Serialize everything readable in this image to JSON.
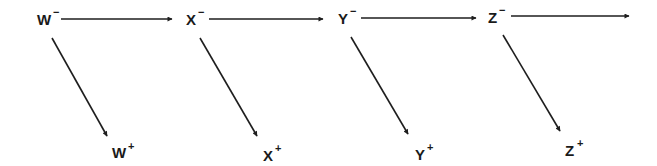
{
  "diagram": {
    "nodes": [
      {
        "id": "W-",
        "base": "W",
        "sign": "−",
        "x": 37,
        "y": 25
      },
      {
        "id": "X-",
        "base": "X",
        "sign": "−",
        "x": 186,
        "y": 25
      },
      {
        "id": "Y-",
        "base": "Y",
        "sign": "−",
        "x": 338,
        "y": 24
      },
      {
        "id": "Z-",
        "base": "Z",
        "sign": "−",
        "x": 488,
        "y": 23
      },
      {
        "id": "W+",
        "base": "W",
        "sign": "+",
        "x": 112,
        "y": 158
      },
      {
        "id": "X+",
        "base": "X",
        "sign": "+",
        "x": 263,
        "y": 161
      },
      {
        "id": "Y+",
        "base": "Y",
        "sign": "+",
        "x": 415,
        "y": 160
      },
      {
        "id": "Z+",
        "base": "Z",
        "sign": "+",
        "x": 565,
        "y": 156
      }
    ],
    "edges": [
      {
        "from": "W-",
        "to": "X-",
        "x1": 61,
        "y1": 19,
        "x2": 172,
        "y2": 19
      },
      {
        "from": "X-",
        "to": "Y-",
        "x1": 209,
        "y1": 19,
        "x2": 323,
        "y2": 19
      },
      {
        "from": "Y-",
        "to": "Z-",
        "x1": 361,
        "y1": 18,
        "x2": 476,
        "y2": 18
      },
      {
        "from": "Z-",
        "to": "",
        "x1": 511,
        "y1": 16,
        "x2": 629,
        "y2": 16
      },
      {
        "from": "W-",
        "to": "W+",
        "x1": 52,
        "y1": 38,
        "x2": 107,
        "y2": 136
      },
      {
        "from": "X-",
        "to": "X+",
        "x1": 200,
        "y1": 38,
        "x2": 257,
        "y2": 136
      },
      {
        "from": "Y-",
        "to": "Y+",
        "x1": 351,
        "y1": 37,
        "x2": 408,
        "y2": 134
      },
      {
        "from": "Z-",
        "to": "Z+",
        "x1": 503,
        "y1": 35,
        "x2": 560,
        "y2": 131
      }
    ]
  },
  "labels": {
    "w_minus": {
      "base": "W",
      "sign": "−"
    },
    "x_minus": {
      "base": "X",
      "sign": "−"
    },
    "y_minus": {
      "base": "Y",
      "sign": "−"
    },
    "z_minus": {
      "base": "Z",
      "sign": "−"
    },
    "w_plus": {
      "base": "W",
      "sign": "+"
    },
    "x_plus": {
      "base": "X",
      "sign": "+"
    },
    "y_plus": {
      "base": "Y",
      "sign": "+"
    },
    "z_plus": {
      "base": "Z",
      "sign": "+"
    }
  },
  "colors": {
    "ink": "#1e1e1e",
    "background": "#ffffff"
  }
}
